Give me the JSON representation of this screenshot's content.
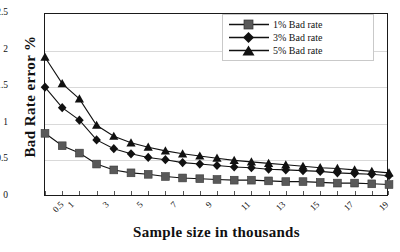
{
  "chart_data": {
    "type": "line",
    "title": "",
    "xlabel": "Sample size in thousands",
    "ylabel": "Bad Rate error %",
    "grid": true,
    "legend_position": "top-right",
    "ylim": [
      0,
      2.5
    ],
    "yticks": [
      "0",
      "0.5",
      "1",
      "1.5",
      "2",
      "2.5"
    ],
    "ytick_values": [
      0,
      0.5,
      1,
      1.5,
      2,
      2.5
    ],
    "categories": [
      "0.5",
      "1",
      "2",
      "3",
      "4",
      "5",
      "6",
      "7",
      "8",
      "9",
      "10",
      "11",
      "12",
      "13",
      "14",
      "15",
      "16",
      "17",
      "18",
      "19",
      "20"
    ],
    "xtick_labels": [
      "0.5",
      "1",
      "",
      "3",
      "",
      "5",
      "",
      "7",
      "",
      "9",
      "",
      "11",
      "",
      "13",
      "",
      "15",
      "",
      "17",
      "",
      "19",
      ""
    ],
    "series": [
      {
        "name": "1% Bad rate",
        "marker": "square",
        "color": "#595959",
        "values": [
          0.87,
          0.7,
          0.6,
          0.45,
          0.37,
          0.33,
          0.31,
          0.28,
          0.26,
          0.25,
          0.24,
          0.23,
          0.23,
          0.22,
          0.21,
          0.21,
          0.2,
          0.19,
          0.19,
          0.18,
          0.17
        ]
      },
      {
        "name": "3% Bad rate",
        "marker": "diamond",
        "color": "#111111",
        "values": [
          1.5,
          1.22,
          1.05,
          0.78,
          0.66,
          0.59,
          0.54,
          0.51,
          0.47,
          0.45,
          0.43,
          0.41,
          0.4,
          0.38,
          0.37,
          0.36,
          0.35,
          0.33,
          0.32,
          0.31,
          0.29
        ]
      },
      {
        "name": "5% Bad rate",
        "marker": "triangle",
        "color": "#111111",
        "values": [
          1.91,
          1.55,
          1.34,
          0.98,
          0.83,
          0.74,
          0.68,
          0.63,
          0.59,
          0.56,
          0.53,
          0.5,
          0.48,
          0.46,
          0.44,
          0.42,
          0.4,
          0.39,
          0.37,
          0.35,
          0.33
        ]
      }
    ]
  },
  "legend": {
    "items": [
      {
        "label": "1% Bad rate"
      },
      {
        "label": "3% Bad rate"
      },
      {
        "label": "5% Bad rate"
      }
    ]
  }
}
